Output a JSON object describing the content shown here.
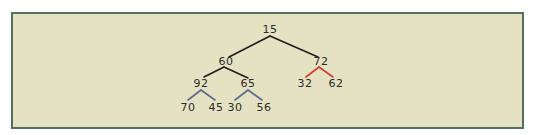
{
  "diagram": {
    "type": "binary-tree",
    "colors": {
      "background": "#e5e1c3",
      "border": "#55705f",
      "edge_default": "#1f1f1f",
      "edge_highlight_red": "#d2412e",
      "edge_highlight_blue": "#5a6a8e",
      "text": "#2b2b2b"
    },
    "nodes": [
      {
        "id": "n15",
        "label": "15",
        "x": 270,
        "y": 33
      },
      {
        "id": "n60",
        "label": "60",
        "x": 226,
        "y": 65
      },
      {
        "id": "n72",
        "label": "72",
        "x": 321,
        "y": 65
      },
      {
        "id": "n92",
        "label": "92",
        "x": 201,
        "y": 87
      },
      {
        "id": "n65",
        "label": "65",
        "x": 248,
        "y": 87
      },
      {
        "id": "n32",
        "label": "32",
        "x": 305,
        "y": 87
      },
      {
        "id": "n62",
        "label": "62",
        "x": 336,
        "y": 87
      },
      {
        "id": "n70",
        "label": "70",
        "x": 188,
        "y": 111
      },
      {
        "id": "n45",
        "label": "45",
        "x": 216,
        "y": 111
      },
      {
        "id": "n30",
        "label": "30",
        "x": 235,
        "y": 111
      },
      {
        "id": "n56",
        "label": "56",
        "x": 264,
        "y": 111
      }
    ],
    "edges": [
      {
        "from": "15",
        "to": "60",
        "color": "black"
      },
      {
        "from": "15",
        "to": "72",
        "color": "black"
      },
      {
        "from": "60",
        "to": "92",
        "color": "black"
      },
      {
        "from": "60",
        "to": "65",
        "color": "black"
      },
      {
        "from": "72",
        "to": "32",
        "color": "red"
      },
      {
        "from": "72",
        "to": "62",
        "color": "red"
      },
      {
        "from": "92",
        "to": "70",
        "color": "blue"
      },
      {
        "from": "92",
        "to": "45",
        "color": "blue"
      },
      {
        "from": "65",
        "to": "30",
        "color": "blue"
      },
      {
        "from": "65",
        "to": "56",
        "color": "blue"
      }
    ]
  }
}
